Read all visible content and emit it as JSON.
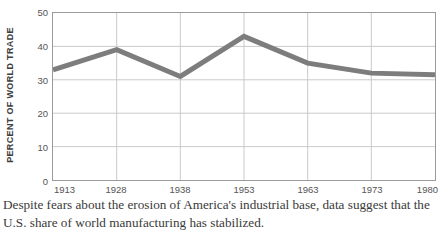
{
  "chart_data": {
    "type": "line",
    "title": "",
    "subtitle": "",
    "xlabel": "",
    "ylabel": "PERCENT OF WORLD TRADE",
    "categories": [
      "1913",
      "1928",
      "1938",
      "1953",
      "1963",
      "1973",
      "1980"
    ],
    "x": [
      1913,
      1928,
      1938,
      1953,
      1963,
      1973,
      1980
    ],
    "values": [
      33,
      39,
      31,
      43,
      35,
      32,
      31.5
    ],
    "series": [
      {
        "name": "U.S. share of world manufacturing",
        "values": [
          33,
          39,
          31,
          43,
          35,
          32,
          31.5
        ]
      }
    ],
    "ylim": [
      0,
      50
    ],
    "yticks": [
      0,
      10,
      20,
      30,
      40,
      50
    ],
    "ytick_labels": [
      "0",
      "10",
      "20",
      "30",
      "40",
      "50"
    ],
    "xtick_labels": [
      "1913",
      "1928",
      "1938",
      "1953",
      "1963",
      "1973",
      "1980"
    ],
    "grid": true,
    "grid_axis": "both",
    "legend": false,
    "legend_position": "none",
    "line_color": "#7d7d7d",
    "line_width_px": 5,
    "grid_color": "#c9c9c9",
    "axis_color": "#9a9a9a",
    "background": "#ffffff"
  },
  "axis": {
    "y_title": "PERCENT OF WORLD TRADE",
    "y_labels": [
      "50",
      "40",
      "30",
      "20",
      "10",
      "0"
    ],
    "x_labels": [
      "1913",
      "1928",
      "1938",
      "1953",
      "1963",
      "1973",
      "1980"
    ]
  },
  "caption": {
    "line1": "Despite fears about the erosion of America's industrial base, data suggest that the",
    "line2": "U.S. share of world manufacturing has stabilized."
  }
}
